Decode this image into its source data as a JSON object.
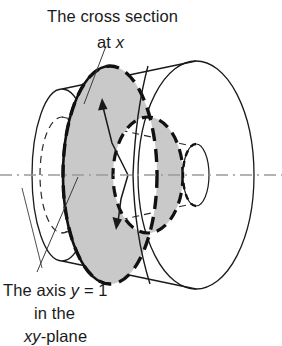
{
  "figure": {
    "kind": "solid-of-revolution-diagram",
    "labels": {
      "top": {
        "line1": "The cross section",
        "line2_prefix": "at ",
        "line2_var": "x"
      },
      "bottom": {
        "line1_prefix": "The axis ",
        "line1_var": "y",
        "line1_suffix": " = 1",
        "line2": "in the",
        "line3_var": "xy",
        "line3_suffix": "-plane"
      }
    },
    "colors": {
      "stroke": "#1a1a1a",
      "washer_fill": "#c9c9c9",
      "hole_fill": "#ffffff",
      "axis": "#9a9a9a",
      "leader": "#3a3a3a",
      "background": "#ffffff"
    },
    "geometry": {
      "axis_y": 175,
      "left_base_center_x": 62,
      "left_base_rx": 30,
      "left_base_ry": 86,
      "right_base_center_x": 196,
      "right_base_rx": 58,
      "right_base_ry": 114,
      "washer_center_x": 110,
      "washer_outer_rx": 47,
      "washer_outer_ry": 109,
      "washer_inner_center_x": 148,
      "washer_inner_rx": 35,
      "washer_inner_ry": 58,
      "apex_circle_center_x": 196,
      "apex_circle_rx": 13,
      "apex_circle_ry": 31
    }
  }
}
